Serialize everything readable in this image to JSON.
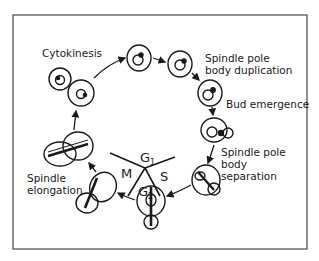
{
  "diagram": {
    "phases": {
      "g1": {
        "main": "G",
        "sub": "1"
      },
      "s": "S",
      "g2": {
        "main": "G",
        "sub": "2"
      },
      "m": "M"
    },
    "labels": {
      "cytokinesis": "Cytokinesis",
      "spb_duplication_1": "Spindle pole",
      "spb_duplication_2": "body duplication",
      "bud_emergence": "Bud emergence",
      "spb_separation_1": "Spindle pole",
      "spb_separation_2": "body",
      "spb_separation_3": "separation",
      "spindle_elongation_1": "Spindle",
      "spindle_elongation_2": "elongation"
    },
    "colors": {
      "ink": "#1a1a1a",
      "frame": "#555555",
      "background": "#ffffff"
    }
  }
}
